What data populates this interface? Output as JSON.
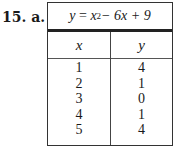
{
  "problem": {
    "number": "15.",
    "part": "a."
  },
  "table": {
    "title": {
      "lhs": "y",
      "eq": "=",
      "x": "x",
      "exp": "2",
      "rest": " − 6x + 9"
    },
    "headers": [
      "x",
      "y"
    ],
    "x_values": [
      "1",
      "2",
      "3",
      "4",
      "5"
    ],
    "y_values": [
      "4",
      "1",
      "0",
      "1",
      "4"
    ]
  }
}
